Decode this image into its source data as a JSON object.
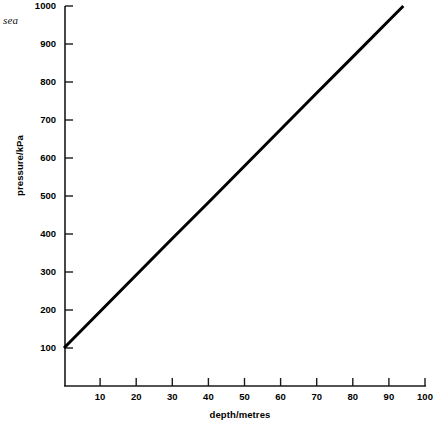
{
  "chart_data": {
    "type": "line",
    "title": "",
    "xlabel": "depth/metres",
    "ylabel": "pressure/kPa",
    "xlim": [
      0,
      100
    ],
    "ylim": [
      0,
      1000
    ],
    "grid": false,
    "legend": null,
    "annotations": [
      {
        "text": "sea",
        "position": "top-left"
      }
    ],
    "xticks": [
      10,
      20,
      30,
      40,
      50,
      60,
      70,
      80,
      90,
      100
    ],
    "xtick_labels": [
      "10",
      "20",
      "30",
      "40",
      "50",
      "60",
      "70",
      "80",
      "90",
      "100"
    ],
    "yticks": [
      100,
      200,
      300,
      400,
      500,
      600,
      700,
      800,
      900,
      1000
    ],
    "ytick_labels": [
      "100",
      "200",
      "300",
      "400",
      "500",
      "600",
      "700",
      "800",
      "900",
      "1000"
    ],
    "series": [
      {
        "name": "pressure vs depth",
        "color": "#000000",
        "linewidth": 3,
        "x": [
          0,
          10,
          20,
          30,
          40,
          50,
          60,
          70,
          80,
          90,
          94
        ],
        "values": [
          100,
          196,
          292,
          388,
          483,
          579,
          675,
          771,
          866,
          962,
          1000
        ]
      }
    ]
  },
  "axis": {
    "y_title": "pressure/kPa",
    "x_title": "depth/metres"
  },
  "labels": {
    "sea": "sea"
  },
  "colors": {
    "line": "#000000",
    "axis": "#1a1a1a",
    "background": "#ffffff"
  }
}
